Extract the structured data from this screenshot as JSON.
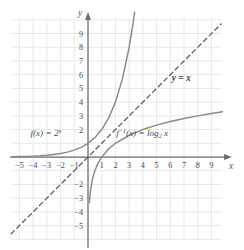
{
  "chart_data": {
    "type": "line",
    "title": "",
    "xlabel": "x",
    "ylabel": "y",
    "xlim": [
      -5.8,
      10.0
    ],
    "ylim": [
      -5.8,
      10.0
    ],
    "grid": true,
    "grid_color": "#e8e8e8",
    "axis_color": "#6e6e6e",
    "curve_color": "#8a8a8a",
    "dash_color": "#5c5c5c",
    "legend_position": "inline-annotations",
    "xticks": [
      -5,
      -4,
      -3,
      -2,
      -1,
      1,
      2,
      3,
      4,
      5,
      6,
      7,
      8,
      9
    ],
    "xtick_labels": [
      "−5",
      "−4",
      "−3",
      "−2",
      "−1",
      "1",
      "2",
      "3",
      "4",
      "5",
      "6",
      "7",
      "8",
      "9"
    ],
    "yticks": [
      9,
      8,
      7,
      6,
      5,
      4,
      3,
      2,
      -2,
      -3,
      -4,
      -5
    ],
    "ytick_labels": [
      "9",
      "8",
      "7",
      "6",
      "5",
      "4",
      "3",
      "2",
      "−2",
      "−3",
      "−4",
      "−5"
    ],
    "series": [
      {
        "name": "f(x) = 2^x",
        "style": "solid",
        "x": [
          -5.5,
          -5,
          -4.5,
          -4,
          -3.5,
          -3,
          -2.5,
          -2,
          -1.5,
          -1,
          -0.5,
          0,
          0.5,
          1,
          1.5,
          2,
          2.5,
          3,
          3.25,
          3.4
        ],
        "y": [
          0.022,
          0.031,
          0.044,
          0.063,
          0.088,
          0.125,
          0.177,
          0.25,
          0.354,
          0.5,
          0.707,
          1,
          1.414,
          2,
          2.828,
          4,
          5.657,
          8,
          9.514,
          10.556
        ]
      },
      {
        "name": "f^-1(x) = log2 x",
        "style": "solid",
        "x": [
          0.1,
          0.15,
          0.2,
          0.3,
          0.4,
          0.5,
          0.7,
          1,
          1.5,
          2,
          3,
          4,
          5,
          6,
          7,
          8,
          9,
          9.8
        ],
        "y": [
          -3.322,
          -2.737,
          -2.322,
          -1.737,
          -1.322,
          -1,
          -0.515,
          0,
          0.585,
          1,
          1.585,
          2,
          2.322,
          2.585,
          2.807,
          3,
          3.17,
          3.293
        ]
      },
      {
        "name": "y = x",
        "style": "dashed",
        "x": [
          -5.6,
          9.7
        ],
        "y": [
          -5.6,
          9.7
        ]
      }
    ],
    "annotations": [
      {
        "id": "f-label",
        "text": "f(x) = 2",
        "superscript": "x",
        "x": -4.2,
        "y": 1.55
      },
      {
        "id": "finv-label",
        "text": "f",
        "superscript": "−1",
        "text2": "(x) = log",
        "subscript": "2",
        "text3": " x",
        "x": 2.05,
        "y": 1.55
      },
      {
        "id": "yx-label",
        "text": "y = x",
        "x": 6.1,
        "y": 5.55
      }
    ]
  },
  "axis_labels": {
    "x": "x",
    "y": "y"
  }
}
